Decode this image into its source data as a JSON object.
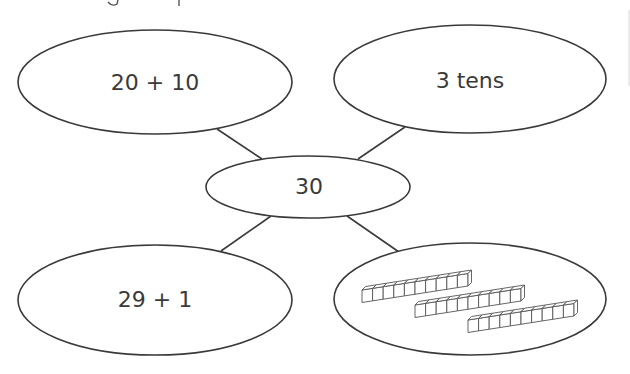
{
  "diagram": {
    "stroke_color": "#3a3a3a",
    "background": "#ffffff",
    "center": {
      "label": "30",
      "cx": 308,
      "cy": 187,
      "rx": 102,
      "ry": 31
    },
    "nodes": [
      {
        "id": "top-left",
        "label": "20 + 10",
        "cx": 155,
        "cy": 82,
        "rx": 137,
        "ry": 52
      },
      {
        "id": "top-right",
        "label": "3 tens",
        "cx": 470,
        "cy": 79,
        "rx": 136,
        "ry": 54
      },
      {
        "id": "bottom-left",
        "label": "29 + 1",
        "cx": 155,
        "cy": 300,
        "rx": 137,
        "ry": 55
      },
      {
        "id": "bottom-right",
        "label": "",
        "cx": 470,
        "cy": 299,
        "rx": 136,
        "ry": 56,
        "picture": "three base-ten rods"
      }
    ],
    "connectors": [
      {
        "from": "top-left",
        "x1": 217,
        "y1": 129,
        "x2": 262,
        "y2": 159
      },
      {
        "from": "top-right",
        "x1": 405,
        "y1": 127,
        "x2": 358,
        "y2": 159
      },
      {
        "from": "bottom-left",
        "x1": 271,
        "y1": 216,
        "x2": 221,
        "y2": 251
      },
      {
        "from": "bottom-right",
        "x1": 347,
        "y1": 216,
        "x2": 399,
        "y2": 252
      }
    ],
    "base_ten_rods": {
      "cubes_per_rod": 10,
      "cube_width": 10.6,
      "cube_height": 12.5,
      "depth_dx": 3.5,
      "depth_dy": -3.5,
      "rise_per_cube": -1.65,
      "rods": [
        {
          "x": 362,
          "y": 290
        },
        {
          "x": 415,
          "y": 305
        },
        {
          "x": 468,
          "y": 320
        }
      ]
    }
  }
}
